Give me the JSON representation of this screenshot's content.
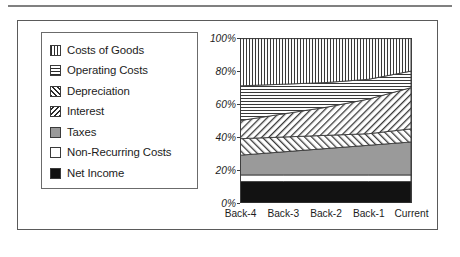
{
  "figure": {
    "has_top_rule": true,
    "frame_border_color": "#5a5a5a"
  },
  "legend": {
    "items": [
      {
        "label": "Costs of Goods",
        "pattern": "vertical-hatch",
        "swatch_class": "sw-vert"
      },
      {
        "label": "Operating Costs",
        "pattern": "horizontal-hatch",
        "swatch_class": "sw-horiz"
      },
      {
        "label": "Depreciation",
        "pattern": "forward-diagonal",
        "swatch_class": "sw-fdiag"
      },
      {
        "label": "Interest",
        "pattern": "backward-diagonal",
        "swatch_class": "sw-bdiag"
      },
      {
        "label": "Taxes",
        "pattern": "solid-gray",
        "swatch_class": "sw-gray"
      },
      {
        "label": "Non-Recurring Costs",
        "pattern": "solid-white",
        "swatch_class": "sw-white"
      },
      {
        "label": "Net Income",
        "pattern": "solid-black",
        "swatch_class": "sw-black"
      }
    ]
  },
  "chart_data": {
    "type": "area",
    "stacked": true,
    "normalized_percent": true,
    "title": "",
    "xlabel": "",
    "ylabel": "",
    "ylim": [
      0,
      100
    ],
    "yticks": [
      0,
      20,
      40,
      60,
      80,
      100
    ],
    "ytick_labels": [
      "0%",
      "20%",
      "40%",
      "60%",
      "80%",
      "100%"
    ],
    "grid": false,
    "legend_position": "left-outside",
    "categories": [
      "Back-4",
      "Back-3",
      "Back-2",
      "Back-1",
      "Current"
    ],
    "stack_order_bottom_to_top": [
      "Net Income",
      "Non-Recurring Costs",
      "Taxes",
      "Interest",
      "Depreciation",
      "Operating Costs",
      "Costs of Goods"
    ],
    "series": [
      {
        "name": "Net Income",
        "fill": "solid-black",
        "values": [
          13,
          13,
          13,
          13,
          13
        ]
      },
      {
        "name": "Non-Recurring Costs",
        "fill": "solid-white",
        "values": [
          4,
          4,
          4,
          4,
          4
        ]
      },
      {
        "name": "Taxes",
        "fill": "solid-gray",
        "values": [
          12,
          14,
          16,
          18,
          20
        ]
      },
      {
        "name": "Interest",
        "fill": "backward-diagonal",
        "values": [
          10,
          9,
          8,
          7,
          8
        ]
      },
      {
        "name": "Depreciation",
        "fill": "forward-diagonal",
        "values": [
          11,
          14,
          17,
          21,
          25
        ]
      },
      {
        "name": "Operating Costs",
        "fill": "horizontal-hatch",
        "values": [
          21,
          18,
          15,
          12,
          10
        ]
      },
      {
        "name": "Costs of Goods",
        "fill": "vertical-hatch",
        "values": [
          29,
          28,
          27,
          25,
          20
        ]
      }
    ],
    "cumulative_boundaries": {
      "net_income_top": [
        13,
        13,
        13,
        13,
        13
      ],
      "non_recurring_top": [
        17,
        17,
        17,
        17,
        17
      ],
      "taxes_top": [
        29,
        31,
        33,
        35,
        37
      ],
      "interest_top": [
        39,
        40,
        41,
        42,
        45
      ],
      "depreciation_top": [
        50,
        54,
        58,
        63,
        70
      ],
      "operating_costs_top": [
        71,
        72,
        73,
        75,
        80
      ],
      "costs_of_goods_top": [
        100,
        100,
        100,
        100,
        100
      ]
    }
  }
}
